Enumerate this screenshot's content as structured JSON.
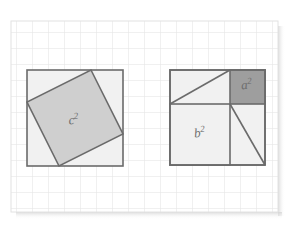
{
  "figure": {
    "background_color": "#ffffff",
    "grid": {
      "name": "graph-paper-grid",
      "line_color": "#e2e2e2",
      "cell_size_px": 16,
      "x0": 11,
      "y0": 21,
      "x1": 278,
      "y1": 212,
      "columns": 17,
      "rows": 12,
      "visible": true
    },
    "shadow": {
      "color": "#d8d8d8",
      "visible": true
    }
  },
  "left_figure": {
    "name": "hypotenuse-square-figure",
    "outer_square": {
      "x": 27,
      "y": 70,
      "size": 96,
      "fill": "#f1f1f1",
      "stroke": "#6b6b6b",
      "stroke_width": 1.6
    },
    "inner_tilted_square": {
      "label": "c²",
      "label_plain": "c2",
      "fill": "#cfcfcf",
      "stroke": "#6b6b6b",
      "stroke_width": 1.6,
      "offset_ratio": 0.33,
      "vertices": [
        {
          "x": 91,
          "y": 70
        },
        {
          "x": 123,
          "y": 134
        },
        {
          "x": 59,
          "y": 166
        },
        {
          "x": 27,
          "y": 102
        }
      ],
      "label_x": 74,
      "label_y": 124,
      "label_rotation": -6,
      "label_font_size": 13,
      "label_color": "#6d6d6d"
    }
  },
  "right_figure": {
    "name": "legs-squares-figure",
    "outer_square": {
      "x": 170,
      "y": 70,
      "size": 95,
      "fill": "#f1f1f1",
      "stroke": "#6b6b6b",
      "stroke_width": 1.6
    },
    "split_ratio": 0.625,
    "b_square": {
      "label": "b²",
      "label_plain": "b2",
      "x": 170,
      "y": 104,
      "width": 60,
      "height": 61,
      "fill": "#f1f1f1",
      "stroke": "#6b6b6b",
      "stroke_width": 1.6,
      "label_x": 200,
      "label_y": 137,
      "label_rotation": -6,
      "label_font_size": 13,
      "label_color": "#6d6d6d"
    },
    "a_square": {
      "label": "a²",
      "label_plain": "a2",
      "x": 230,
      "y": 70,
      "width": 35,
      "height": 34,
      "fill": "#9e9e9e",
      "stroke": "#6b6b6b",
      "stroke_width": 1.6,
      "label_x": 247,
      "label_y": 89,
      "label_rotation": -6,
      "label_font_size": 13,
      "label_color": "#5a5a5a"
    },
    "top_left_rectangle": {
      "name": "top-left-rectangle",
      "x": 170,
      "y": 70,
      "width": 60,
      "height": 34,
      "fill": "#f1f1f1"
    },
    "right_strip": {
      "name": "right-strip",
      "x": 230,
      "y": 104,
      "width": 35,
      "height": 61,
      "fill": "#f1f1f1"
    },
    "diagonals": [
      {
        "name": "top-left-diagonal",
        "x1": 170,
        "y1": 104,
        "x2": 230,
        "y2": 70,
        "stroke": "#6b6b6b",
        "stroke_width": 1.6
      },
      {
        "name": "right-strip-diagonal",
        "x1": 230,
        "y1": 104,
        "x2": 265,
        "y2": 165,
        "stroke": "#6b6b6b",
        "stroke_width": 1.6
      }
    ]
  },
  "colors": {
    "grid_line": "#e2e2e2",
    "outline": "#6b6b6b",
    "fill_light": "#f1f1f1",
    "fill_medium": "#cfcfcf",
    "fill_dark": "#9e9e9e",
    "label": "#6d6d6d",
    "background": "#ffffff"
  }
}
